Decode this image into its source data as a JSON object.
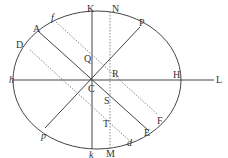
{
  "diagram": {
    "colors": {
      "line": "#444444",
      "dotted": "#888888",
      "text": "#333333",
      "background": "#ffffff"
    },
    "ellipse": {
      "cx": 97,
      "cy": 80,
      "rx": 84,
      "ry": 69
    },
    "labels": {
      "K": "K",
      "N": "N",
      "P": "P",
      "A": "A",
      "f": "f",
      "D": "D",
      "h": "h",
      "H": "H",
      "L": "L",
      "Q": "Q",
      "R": "R",
      "C": "C",
      "S": "S",
      "T": "T",
      "p": "p",
      "k": "k",
      "M": "M",
      "d": "d",
      "E": "E",
      "F": "F"
    }
  }
}
